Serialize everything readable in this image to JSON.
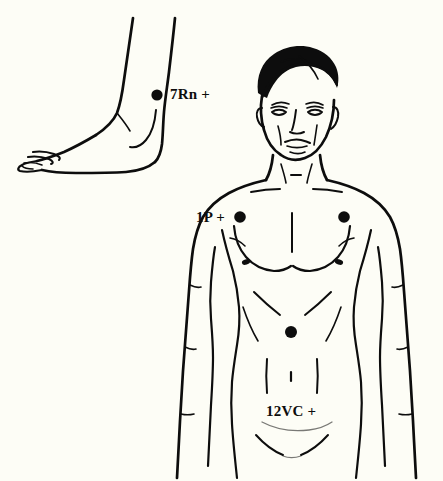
{
  "figure": {
    "background_color": "#fdfdf6",
    "ink_color": "#0d0d0d",
    "width": 443,
    "height": 481
  },
  "panels": [
    {
      "id": "foot-panel",
      "name": "foot-lateral-view",
      "label": "Foot and ankle, lateral view"
    },
    {
      "id": "torso-panel",
      "name": "male-torso-front-view",
      "label": "Male torso, anterior view"
    }
  ],
  "points": [
    {
      "id": "7rn",
      "label": "7Rn +",
      "code": "7Rn",
      "marker": "+",
      "region": "ankle",
      "x": 157,
      "y": 95,
      "radius": 5.6,
      "color": "#0d0d0d"
    },
    {
      "id": "1p-left",
      "label": "1P +",
      "code": "1P",
      "marker": "+",
      "region": "upper-chest-left",
      "x": 240,
      "y": 217,
      "radius": 5.8,
      "color": "#0d0d0d"
    },
    {
      "id": "1p-right",
      "label": "",
      "code": "1P",
      "marker": "",
      "region": "upper-chest-right",
      "x": 344,
      "y": 217,
      "radius": 5.8,
      "color": "#0d0d0d"
    },
    {
      "id": "12vc",
      "label": "12VC +",
      "code": "12VC",
      "marker": "+",
      "region": "upper-abdomen",
      "x": 291,
      "y": 332,
      "radius": 6.0,
      "color": "#0d0d0d"
    }
  ],
  "labels": {
    "ankle_point": "7Rn +",
    "chest_point": "1P +",
    "abdomen_point": "12VC +"
  }
}
